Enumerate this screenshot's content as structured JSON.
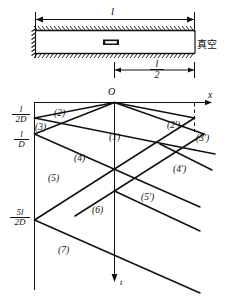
{
  "figure": {
    "type": "x-t characteristic wave diagram of a shock tube discharging into vacuum"
  },
  "tube": {
    "length_label": "l",
    "half_length_num": "l",
    "half_length_den": "2",
    "vacuum_label": "真空",
    "diaphragm_name": "diaphragm"
  },
  "axes": {
    "origin": "O",
    "x_label": "x",
    "t_label": "t"
  },
  "tick_labels": [
    {
      "id": "t1",
      "num": "l",
      "den": "2D"
    },
    {
      "id": "t2",
      "num": "l",
      "den": "D"
    },
    {
      "id": "t3",
      "num": "5l",
      "den": "2D"
    }
  ],
  "regions": [
    {
      "id": "r1",
      "label": "(1)"
    },
    {
      "id": "r2",
      "label": "(2)"
    },
    {
      "id": "r3",
      "label": "(3)"
    },
    {
      "id": "r4",
      "label": "(4)"
    },
    {
      "id": "r5",
      "label": "(5)"
    },
    {
      "id": "r6",
      "label": "(6)"
    },
    {
      "id": "r7",
      "label": "(7)"
    },
    {
      "id": "r2p",
      "label": "(2')"
    },
    {
      "id": "r3p",
      "label": "(3')"
    },
    {
      "id": "r4p",
      "label": "(4')"
    },
    {
      "id": "r5p",
      "label": "(5')"
    }
  ],
  "colors": {
    "line": "#111111",
    "background": "#ffffff"
  }
}
